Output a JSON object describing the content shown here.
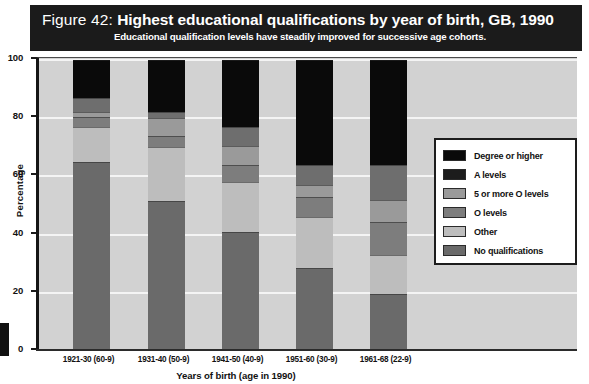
{
  "figure": {
    "number": "Figure 42:",
    "title": "Highest educational qualifications by year of birth, GB, 1990",
    "subtitle": "Educational qualification levels have steadily improved for successive age cohorts."
  },
  "chart_data": {
    "type": "bar",
    "stacked": true,
    "title": "Highest educational qualifications by year of birth, GB, 1990",
    "subtitle": "Educational qualification levels have steadily improved for successive age cohorts.",
    "xlabel": "Years of birth (age in 1990)",
    "ylabel": "Percentage",
    "ylim": [
      0,
      100
    ],
    "yticks": [
      0,
      20,
      40,
      60,
      80,
      100
    ],
    "ytick_labels": [
      "0",
      "20",
      "40",
      "60",
      "80",
      "100"
    ],
    "grid": true,
    "legend_position": "right-inside",
    "categories": [
      "1921-30 (60-9)",
      "1931-40 (50-9)",
      "1941-50 (40-9)",
      "1951-60 (30-9)",
      "1961-68 (22-9)"
    ],
    "series": [
      {
        "name": "Degree or higher",
        "color": "#0a0a0a",
        "values": [
          13,
          18,
          23,
          36,
          36
        ]
      },
      {
        "name": "A levels",
        "color": "#6e6e6e",
        "values": [
          5,
          2,
          6.5,
          7,
          12
        ]
      },
      {
        "name": "5 or more O levels",
        "color": "#9a9a9a",
        "values": [
          1.5,
          6,
          6.5,
          4,
          7.5
        ]
      },
      {
        "name": "O levels",
        "color": "#7d7d7d",
        "values": [
          3.5,
          4,
          6,
          7,
          11.5
        ]
      },
      {
        "name": "Other",
        "color": "#bdbdbd",
        "values": [
          12,
          18.5,
          17,
          17.5,
          13.5
        ]
      },
      {
        "name": "No qualifications",
        "color": "#6a6a6a",
        "values": [
          65,
          51.5,
          41,
          28.5,
          19.5
        ]
      }
    ]
  },
  "legend": {
    "items": [
      {
        "label": "Degree or higher",
        "color": "#0a0a0a"
      },
      {
        "label": "A levels",
        "color": "#1c1c1c"
      },
      {
        "label": "5 or more O levels",
        "color": "#9a9a9a"
      },
      {
        "label": "O levels",
        "color": "#7d7d7d"
      },
      {
        "label": "Other",
        "color": "#bdbdbd"
      },
      {
        "label": "No qualifications",
        "color": "#6a6a6a"
      }
    ]
  },
  "colors": {
    "banner_bg": "#1b1b1b",
    "banner_text": "#ffffff",
    "plot_bg": "#d2d2d2",
    "gridline": "#f4f4f4",
    "axis": "#1a1a1a"
  }
}
